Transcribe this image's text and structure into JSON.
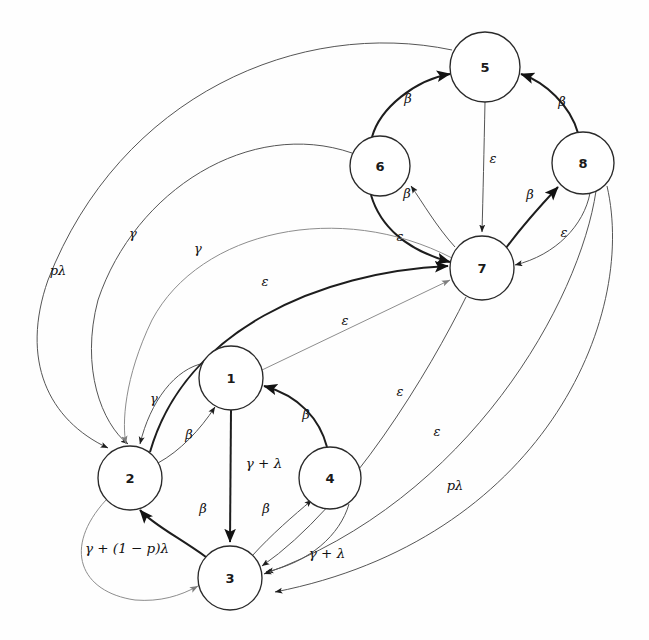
{
  "diagram": {
    "type": "state-transition-graph",
    "background_color": "#fefefe",
    "node_fill": "#ffffff",
    "node_stroke": "#2a2a2a",
    "edge_color": "#3a3a3a",
    "nodes": [
      {
        "id": "1",
        "label": "1",
        "cx": 231,
        "cy": 378,
        "r": 32
      },
      {
        "id": "2",
        "label": "2",
        "cx": 130,
        "cy": 478,
        "r": 32
      },
      {
        "id": "3",
        "label": "3",
        "cx": 230,
        "cy": 578,
        "r": 32
      },
      {
        "id": "4",
        "label": "4",
        "cx": 330,
        "cy": 478,
        "r": 31
      },
      {
        "id": "5",
        "label": "5",
        "cx": 485,
        "cy": 67,
        "r": 35
      },
      {
        "id": "6",
        "label": "6",
        "cx": 380,
        "cy": 166,
        "r": 30
      },
      {
        "id": "7",
        "label": "7",
        "cx": 482,
        "cy": 268,
        "r": 32
      },
      {
        "id": "8",
        "label": "8",
        "cx": 583,
        "cy": 163,
        "r": 31
      }
    ],
    "edges": [
      {
        "from": "6",
        "to": "5",
        "label": "β",
        "label_x": 408,
        "label_y": 98,
        "style": "bold"
      },
      {
        "from": "8",
        "to": "5",
        "label": "β",
        "label_x": 562,
        "label_y": 101,
        "style": "bold"
      },
      {
        "from": "5",
        "to": "7",
        "label": "ε",
        "label_x": 493,
        "label_y": 158,
        "style": "thin"
      },
      {
        "from": "7",
        "to": "6",
        "label": "β",
        "label_x": 407,
        "label_y": 193,
        "style": "thin"
      },
      {
        "from": "6",
        "to": "7",
        "label": "ε",
        "label_x": 400,
        "label_y": 236,
        "style": "bold"
      },
      {
        "from": "7",
        "to": "8",
        "label": "β",
        "label_x": 530,
        "label_y": 194,
        "style": "bold"
      },
      {
        "from": "8",
        "to": "7",
        "label": "ε",
        "label_x": 564,
        "label_y": 232,
        "style": "thin"
      },
      {
        "from": "2",
        "to": "1",
        "label": "β",
        "label_x": 189,
        "label_y": 434,
        "style": "thin"
      },
      {
        "from": "1",
        "to": "2",
        "label": "γ",
        "label_x": 154,
        "label_y": 398,
        "style": "thin"
      },
      {
        "from": "4",
        "to": "1",
        "label": "β",
        "label_x": 306,
        "label_y": 414,
        "style": "bold"
      },
      {
        "from": "1",
        "to": "3",
        "label": "γ + λ",
        "label_x": 264,
        "label_y": 463,
        "style": "bold"
      },
      {
        "from": "3",
        "to": "2",
        "label": "β",
        "label_x": 203,
        "label_y": 508,
        "style": "bold"
      },
      {
        "from": "3",
        "to": "4",
        "label": "β",
        "label_x": 266,
        "label_y": 508,
        "style": "thin"
      },
      {
        "from": "4",
        "to": "3",
        "label": "γ + λ",
        "label_x": 327,
        "label_y": 553,
        "style": "thin"
      },
      {
        "from": "2",
        "to": "7",
        "label": "ε",
        "label_x": 265,
        "label_y": 281,
        "style": "bold"
      },
      {
        "from": "1",
        "to": "7",
        "label": "ε",
        "label_x": 345,
        "label_y": 320,
        "style": "faint"
      },
      {
        "from": "5",
        "to": "2",
        "label": "pλ",
        "label_x": 58,
        "label_y": 270,
        "style": "thin"
      },
      {
        "from": "6",
        "to": "2",
        "label": "γ",
        "label_x": 133,
        "label_y": 233,
        "style": "thin"
      },
      {
        "from": "7",
        "to": "2",
        "label": "γ",
        "label_x": 198,
        "label_y": 248,
        "style": "faint"
      },
      {
        "from": "7",
        "to": "3",
        "label": "ε",
        "label_x": 400,
        "label_y": 391,
        "style": "thin"
      },
      {
        "from": "8",
        "to": "3",
        "label": "ε",
        "label_x": 437,
        "label_y": 431,
        "style": "thin"
      },
      {
        "from": "8",
        "to": "3",
        "label": "pλ",
        "label_x": 455,
        "label_y": 485,
        "style": "thin"
      },
      {
        "from": "2",
        "to": "3",
        "label": "γ + (1 − p)λ",
        "label_x": 127,
        "label_y": 548,
        "style": "faint"
      }
    ],
    "symbols": {
      "beta": "β",
      "gamma": "γ",
      "epsilon": "ε",
      "lambda": "λ",
      "p_lambda": "pλ",
      "gamma_plus_lambda": "γ + λ",
      "gamma_plus_one_minus_p_lambda": "γ + (1 − p)λ"
    }
  }
}
